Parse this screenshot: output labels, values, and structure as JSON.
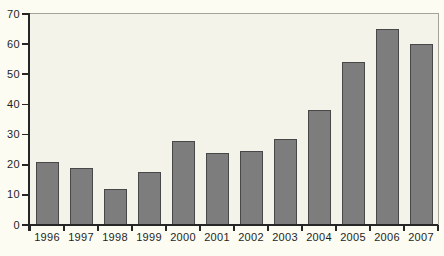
{
  "chart_data": {
    "type": "bar",
    "title": "",
    "xlabel": "",
    "ylabel": "",
    "categories": [
      "1996",
      "1997",
      "1998",
      "1999",
      "2000",
      "2001",
      "2002",
      "2003",
      "2004",
      "2005",
      "2006",
      "2007"
    ],
    "values": [
      21,
      19,
      12,
      17.5,
      28,
      24,
      24.5,
      28.5,
      38,
      54,
      65,
      60
    ],
    "ylim": [
      0,
      70
    ],
    "yticks": [
      0,
      10,
      20,
      30,
      40,
      50,
      60,
      70
    ],
    "grid": false,
    "legend": "none",
    "colors": {
      "bar_fill": "#7d7d7d",
      "bar_border": "#484848",
      "page_background": "#fcfcf3",
      "plot_background": "#f3f3ea",
      "frame": "#a3a39a",
      "axis": "#262626",
      "text": "#1f1f1f"
    }
  }
}
